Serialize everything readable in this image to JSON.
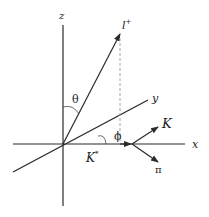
{
  "diagram": {
    "axes": {
      "x_label": "x",
      "y_label": "y",
      "z_label": "z"
    },
    "vectors": {
      "lepton_label": "l",
      "lepton_superscript": "+",
      "kstar_label": "K",
      "kstar_superscript": "*",
      "kaon_label": "K",
      "pion_label": "π"
    },
    "angles": {
      "theta_label": "θ",
      "phi_label": "ϕ"
    },
    "colors": {
      "line": "#2a2a2a",
      "dashed": "#9a9a9a",
      "background": "#ffffff"
    }
  }
}
